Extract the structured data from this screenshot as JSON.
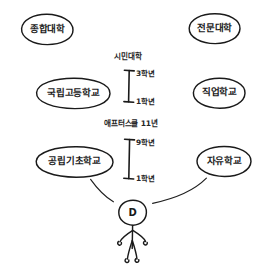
{
  "diagram": {
    "style": "hand-drawn sketch",
    "ink_color": "#1a1a1a",
    "background_color": "#ffffff",
    "nodes": [
      {
        "id": "n1",
        "label": "종합대학",
        "row": "top",
        "column": "left"
      },
      {
        "id": "n2",
        "label": "전문대학",
        "row": "top",
        "column": "right"
      },
      {
        "id": "n3",
        "label": "국립고등학교",
        "row": "middle",
        "column": "left"
      },
      {
        "id": "n4",
        "label": "직업학교",
        "row": "middle",
        "column": "right"
      },
      {
        "id": "n5",
        "label": "공립기초학교",
        "row": "bottom",
        "column": "left"
      },
      {
        "id": "n6",
        "label": "자유학교",
        "row": "bottom",
        "column": "right"
      }
    ],
    "stages": [
      {
        "id": "s1",
        "label": "시민대학",
        "grade_top": "3학년",
        "grade_bottom": "1학년"
      },
      {
        "id": "s2",
        "label": "애프터스쿨 11년",
        "grade_top": "9학년",
        "grade_bottom": "1학년"
      }
    ],
    "person": {
      "label": "D",
      "name": "stick-figure-student"
    }
  }
}
